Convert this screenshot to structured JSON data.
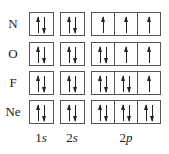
{
  "diagram": {
    "rows": [
      {
        "element": "N",
        "s1": "updown",
        "s2": "updown",
        "p": [
          "up",
          "up",
          "up"
        ]
      },
      {
        "element": "O",
        "s1": "updown",
        "s2": "updown",
        "p": [
          "updown",
          "up",
          "up"
        ]
      },
      {
        "element": "F",
        "s1": "updown",
        "s2": "updown",
        "p": [
          "updown",
          "updown",
          "up"
        ]
      },
      {
        "element": "Ne",
        "s1": "updown",
        "s2": "updown",
        "p": [
          "updown",
          "updown",
          "updown"
        ]
      }
    ],
    "orbital_labels": {
      "s1_num": "1",
      "s1_sub": "s",
      "s2_num": "2",
      "s2_sub": "s",
      "p_num": "2",
      "p_sub": "p"
    }
  }
}
